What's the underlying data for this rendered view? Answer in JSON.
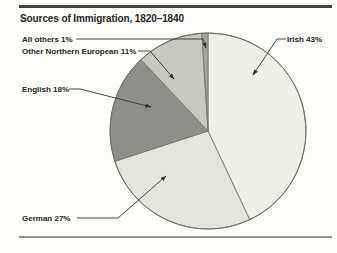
{
  "page": {
    "title": "Sources of Immigration, 1820–1840"
  },
  "chart_data": {
    "type": "pie",
    "title": "Sources of Immigration, 1820–1840",
    "direction": "clockwise",
    "start": "12 o'clock",
    "slices": [
      {
        "label": "Irish",
        "value": 43,
        "unit": "%",
        "color": "#f0efe7"
      },
      {
        "label": "German",
        "value": 27,
        "unit": "%",
        "color": "#e3e4da"
      },
      {
        "label": "English",
        "value": 18,
        "unit": "%",
        "color": "#8f8f8a"
      },
      {
        "label": "Other Northern European",
        "value": 11,
        "unit": "%",
        "color": "#c7c8bf"
      },
      {
        "label": "All others",
        "value": 1,
        "unit": "%",
        "color": "#a3a49b"
      }
    ],
    "callouts": {
      "all_others": "All others 1%",
      "other_northern_european": "Other Northern European 11%",
      "english": "English 18%",
      "irish": "Irish 43%",
      "german": "German 27%"
    }
  },
  "colors": {
    "background": "#fdfdfa",
    "text": "#24241f",
    "wedge_outline": "#6e6e67",
    "leader_line": "#33332e",
    "top_rule": "#45453f",
    "bottom_rule": "#97978f"
  }
}
